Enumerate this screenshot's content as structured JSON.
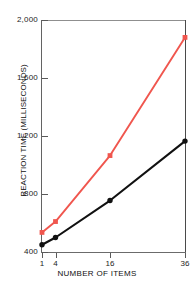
{
  "chart_data": {
    "type": "line",
    "title": "",
    "xlabel": "NUMBER OF ITEMS",
    "ylabel": "REACTION TIME (MILLISECONDS)",
    "x": [
      1,
      4,
      16,
      36
    ],
    "xtick_labels": [
      "1",
      "4",
      "16",
      "36"
    ],
    "ytick_labels": [
      "400",
      "800",
      "1,200",
      "1,600",
      "2,000"
    ],
    "ytick_values": [
      400,
      800,
      1200,
      1600,
      2000
    ],
    "ylim": [
      400,
      2000
    ],
    "grid": false,
    "legend": "none",
    "series": [
      {
        "name": "red-series",
        "color": "#F0564E",
        "marker": "square",
        "values": [
          535,
          610,
          1065,
          1880
        ]
      },
      {
        "name": "black-series",
        "color": "#111111",
        "marker": "circle",
        "values": [
          450,
          500,
          755,
          1165
        ]
      }
    ]
  },
  "axis": {
    "y_title": "REACTION TIME (MILLISECONDS)",
    "x_title": "NUMBER OF ITEMS"
  }
}
